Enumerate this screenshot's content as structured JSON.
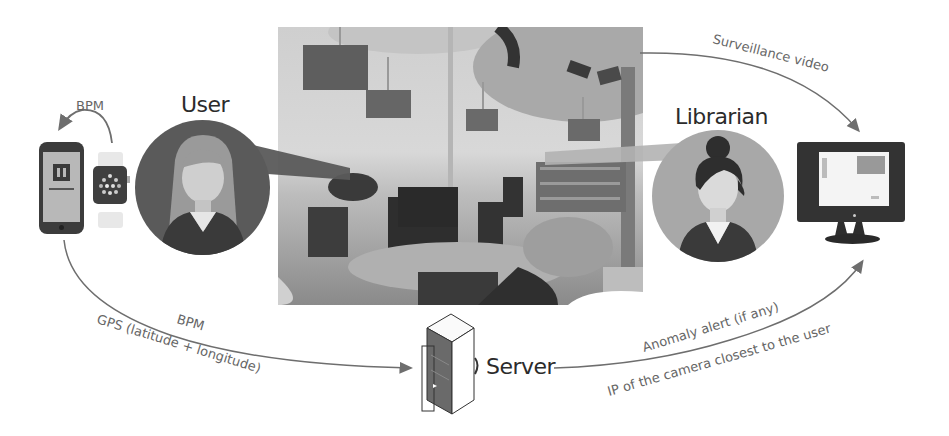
{
  "diagram": {
    "actors": {
      "user": {
        "label": "User"
      },
      "librarian": {
        "label": "Librarian"
      },
      "server": {
        "label": "Server"
      }
    },
    "devices": {
      "phone": {
        "icon": "smartphone-icon"
      },
      "watch": {
        "icon": "smartwatch-icon"
      },
      "monitor": {
        "icon": "monitor-icon"
      },
      "server": {
        "icon": "server-tower-icon"
      }
    },
    "photo": {
      "description": "Library interior with computer desks and ceiling-mounted surveillance camera"
    },
    "flows": {
      "watch_to_phone": "BPM",
      "phone_to_server_line1": "BPM",
      "phone_to_server_line2": "GPS (latitude + longitude)",
      "camera_to_monitor": "Surveillance video",
      "server_to_monitor_line1": "Anomaly alert (if any)",
      "server_to_monitor_line2": "IP of the camera closest to the user"
    },
    "colors": {
      "arrow": "#6e6e6e",
      "user_circle": "#5a5a5a",
      "librarian_circle": "#a8a8a8",
      "text": "#2b2b2b",
      "flow_text": "#666666"
    }
  }
}
